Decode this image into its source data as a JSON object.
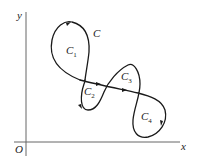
{
  "figure": {
    "axes": {
      "x_label": "x",
      "y_label": "y",
      "origin_label": "O"
    },
    "curve": {
      "name": "C",
      "regions": [
        {
          "label": "C",
          "sub": "1"
        },
        {
          "label": "C",
          "sub": "2"
        },
        {
          "label": "C",
          "sub": "3"
        },
        {
          "label": "C",
          "sub": "4"
        }
      ]
    },
    "colors": {
      "stroke": "#1a1a1a",
      "axis": "#555555",
      "background": "#ffffff"
    }
  }
}
